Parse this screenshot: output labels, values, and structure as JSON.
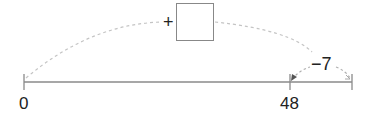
{
  "diagram": {
    "type": "number-line",
    "colors": {
      "axis": "#888888",
      "arc": "#bbbbbb",
      "text": "#222222"
    },
    "ticks": [
      {
        "label": "0",
        "value": 0
      },
      {
        "label": "48",
        "value": 48
      },
      {
        "label": "",
        "value": null
      }
    ],
    "big_jump": {
      "operator": "+",
      "answer_box": ""
    },
    "small_jump": {
      "label": "−7"
    }
  }
}
